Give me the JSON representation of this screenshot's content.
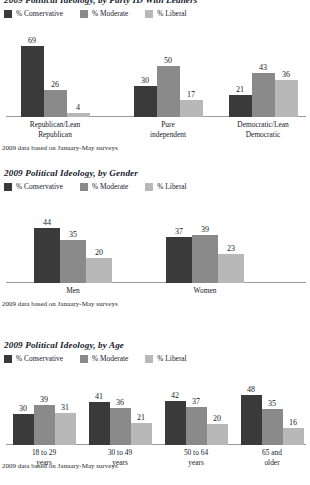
{
  "colors": {
    "conservative": "#3a3a3a",
    "moderate": "#8a8a8a",
    "liberal": "#b8b8b8",
    "axis": "#9a9a9a",
    "text": "#15212b",
    "background": "#ffffff"
  },
  "legend": {
    "conservative": "% Conservative",
    "moderate": "% Moderate",
    "liberal": "% Liberal"
  },
  "footnote": "2009 data based on January-May surveys",
  "chart_data": [
    {
      "type": "bar",
      "id": "party",
      "title": "2009 Political Ideology, by Party ID With Leaners",
      "categories": [
        "Republican/Lean\nRepublican",
        "Pure independent",
        "Democratic/Lean\nDemocratic"
      ],
      "series": [
        {
          "name": "% Conservative",
          "values": [
            69,
            30,
            21
          ]
        },
        {
          "name": "% Moderate",
          "values": [
            26,
            50,
            43
          ]
        },
        {
          "name": "% Liberal",
          "values": [
            4,
            17,
            36
          ]
        }
      ],
      "xlabel": "",
      "ylabel": "",
      "ylim": [
        0,
        72
      ],
      "grid": false,
      "legend_position": "top-left",
      "footnote": "2009 data based on January-May surveys"
    },
    {
      "type": "bar",
      "id": "gender",
      "title": "2009 Political Ideology, by Gender",
      "categories": [
        "Men",
        "Women"
      ],
      "series": [
        {
          "name": "% Conservative",
          "values": [
            44,
            37
          ]
        },
        {
          "name": "% Moderate",
          "values": [
            35,
            39
          ]
        },
        {
          "name": "% Liberal",
          "values": [
            20,
            23
          ]
        }
      ],
      "xlabel": "",
      "ylabel": "",
      "ylim": [
        0,
        50
      ],
      "grid": false,
      "legend_position": "top-left",
      "footnote": "2009 data based on January-May surveys"
    },
    {
      "type": "bar",
      "id": "age",
      "title": "2009 Political Ideology, by Age",
      "categories": [
        "18 to 29 years",
        "30 to 49 years",
        "50 to 64 years",
        "65 and older"
      ],
      "series": [
        {
          "name": "% Conservative",
          "values": [
            30,
            41,
            42,
            48
          ]
        },
        {
          "name": "% Moderate",
          "values": [
            39,
            36,
            37,
            35
          ]
        },
        {
          "name": "% Liberal",
          "values": [
            31,
            21,
            20,
            16
          ]
        }
      ],
      "xlabel": "",
      "ylabel": "",
      "ylim": [
        0,
        52
      ],
      "grid": false,
      "legend_position": "top-left",
      "footnote": "2009 data based on January-May surveys"
    }
  ]
}
